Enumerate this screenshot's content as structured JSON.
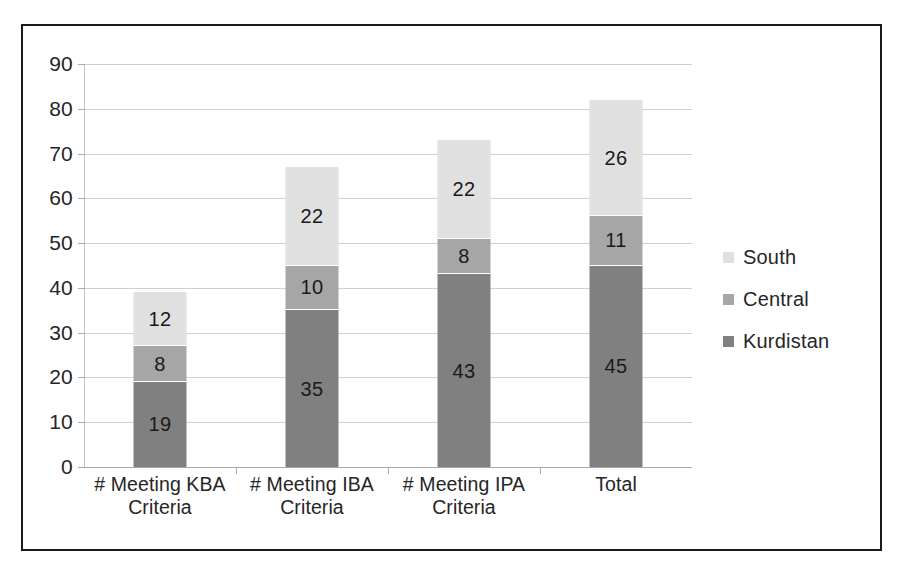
{
  "figure": {
    "border_color": "#1a1a1a",
    "background": "#ffffff",
    "caption_partial": ""
  },
  "legend": {
    "position": "right",
    "items": [
      {
        "label": "South",
        "color": "#e0e0e0"
      },
      {
        "label": "Central",
        "color": "#a6a6a6"
      },
      {
        "label": "Kurdistan",
        "color": "#808080"
      }
    ]
  },
  "y_axis": {
    "ticks": [
      "0",
      "10",
      "20",
      "30",
      "40",
      "50",
      "60",
      "70",
      "80",
      "90"
    ],
    "min": 0,
    "max": 90,
    "step": 10
  },
  "x_axis": {
    "categories": [
      {
        "line1": "# Meeting KBA",
        "line2": "Criteria"
      },
      {
        "line1": "# Meeting IBA",
        "line2": "Criteria"
      },
      {
        "line1": "# Meeting IPA",
        "line2": "Criteria"
      },
      {
        "line1": "Total",
        "line2": ""
      }
    ]
  },
  "chart_data": {
    "type": "bar",
    "subtype": "stacked-vertical",
    "title": "",
    "subtitle": "",
    "xlabel": "",
    "ylabel": "",
    "ylim": [
      0,
      90
    ],
    "ytick_step": 10,
    "grid": true,
    "legend_position": "right",
    "categories": [
      "# Meeting KBA Criteria",
      "# Meeting IBA Criteria",
      "# Meeting IPA Criteria",
      "Total"
    ],
    "series": [
      {
        "name": "Kurdistan",
        "color": "#808080",
        "values": [
          19,
          35,
          43,
          45
        ]
      },
      {
        "name": "Central",
        "color": "#a6a6a6",
        "values": [
          8,
          10,
          8,
          11
        ]
      },
      {
        "name": "South",
        "color": "#e0e0e0",
        "values": [
          12,
          22,
          22,
          26
        ]
      }
    ],
    "stack_order_bottom_to_top": [
      "Kurdistan",
      "Central",
      "South"
    ],
    "totals": [
      39,
      67,
      73,
      82
    ],
    "data_labels": true,
    "bars": [
      {
        "category": "# Meeting KBA Criteria",
        "segments": [
          {
            "name": "Kurdistan",
            "value": 19,
            "label": "19",
            "color": "#808080"
          },
          {
            "name": "Central",
            "value": 8,
            "label": "8",
            "color": "#a6a6a6"
          },
          {
            "name": "South",
            "value": 12,
            "label": "12",
            "color": "#e0e0e0"
          }
        ],
        "total": 39
      },
      {
        "category": "# Meeting IBA Criteria",
        "segments": [
          {
            "name": "Kurdistan",
            "value": 35,
            "label": "35",
            "color": "#808080"
          },
          {
            "name": "Central",
            "value": 10,
            "label": "10",
            "color": "#a6a6a6"
          },
          {
            "name": "South",
            "value": 22,
            "label": "22",
            "color": "#e0e0e0"
          }
        ],
        "total": 67
      },
      {
        "category": "# Meeting IPA Criteria",
        "segments": [
          {
            "name": "Kurdistan",
            "value": 43,
            "label": "43",
            "color": "#808080"
          },
          {
            "name": "Central",
            "value": 8,
            "label": "8",
            "color": "#a6a6a6"
          },
          {
            "name": "South",
            "value": 22,
            "label": "22",
            "color": "#e0e0e0"
          }
        ],
        "total": 73
      },
      {
        "category": "Total",
        "segments": [
          {
            "name": "Kurdistan",
            "value": 45,
            "label": "45",
            "color": "#808080"
          },
          {
            "name": "Central",
            "value": 11,
            "label": "11",
            "color": "#a6a6a6"
          },
          {
            "name": "South",
            "value": 26,
            "label": "26",
            "color": "#e0e0e0"
          }
        ],
        "total": 82
      }
    ]
  }
}
